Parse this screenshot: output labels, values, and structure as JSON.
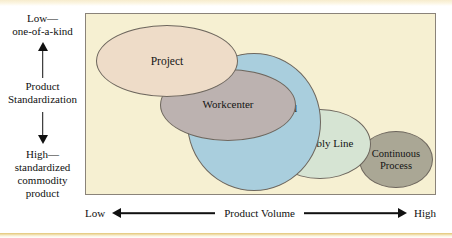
{
  "figure": {
    "name": "product-process-matrix",
    "frame_bg": "#f6f0d2",
    "frame_border": "#8a8379"
  },
  "y_axis": {
    "top_label": "Low—\none-of-a-kind",
    "title": "Product\nStandardization",
    "bottom_label": "High—\nstandardized\ncommodity\nproduct",
    "up_arrow_icon": "arrow-up-icon",
    "down_arrow_icon": "arrow-down-icon"
  },
  "x_axis": {
    "low_label": "Low",
    "title": "Product Volume",
    "high_label": "High",
    "left_arrow_icon": "arrow-left-icon",
    "right_arrow_icon": "arrow-right-icon"
  },
  "processes": [
    {
      "id": "project",
      "label": "Project",
      "color": "#eedcc8"
    },
    {
      "id": "workcenter",
      "label": "Workcenter",
      "color": "#bcb2b0"
    },
    {
      "id": "manufacturing-cell",
      "label": "Manufacturing\nCell",
      "color": "#a9cedd"
    },
    {
      "id": "assembly-line",
      "label": "Assembly\nLine",
      "color": "#d6e4d3"
    },
    {
      "id": "continuous-process",
      "label": "Continuous\nProcess",
      "color": "#aaa795"
    }
  ]
}
